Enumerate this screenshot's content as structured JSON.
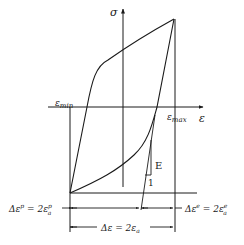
{
  "diagram": {
    "axes": {
      "y_label": "σ",
      "x_label": "ε"
    },
    "markers": {
      "eps_min": "εmin",
      "eps_max": "εmax"
    },
    "slope": {
      "rise_label": "E",
      "run_label": "1"
    },
    "dimensions": {
      "plastic": "Δεp = 2εpa",
      "plastic_parts": {
        "lhs": "Δε",
        "lhs_sup": "p",
        "eq": " = 2ε",
        "sub": "a",
        "sup": "p"
      },
      "elastic": "Δεe = 2εea",
      "elastic_parts": {
        "lhs": "Δε",
        "lhs_sup": "e",
        "eq": " = 2ε",
        "sub": "a",
        "sup": "e"
      },
      "total": "Δε = 2εa",
      "total_parts": {
        "lhs": "Δε = 2ε",
        "sub": "a"
      }
    },
    "colors": {
      "line": "#1a1a1a",
      "background": "#ffffff"
    }
  }
}
